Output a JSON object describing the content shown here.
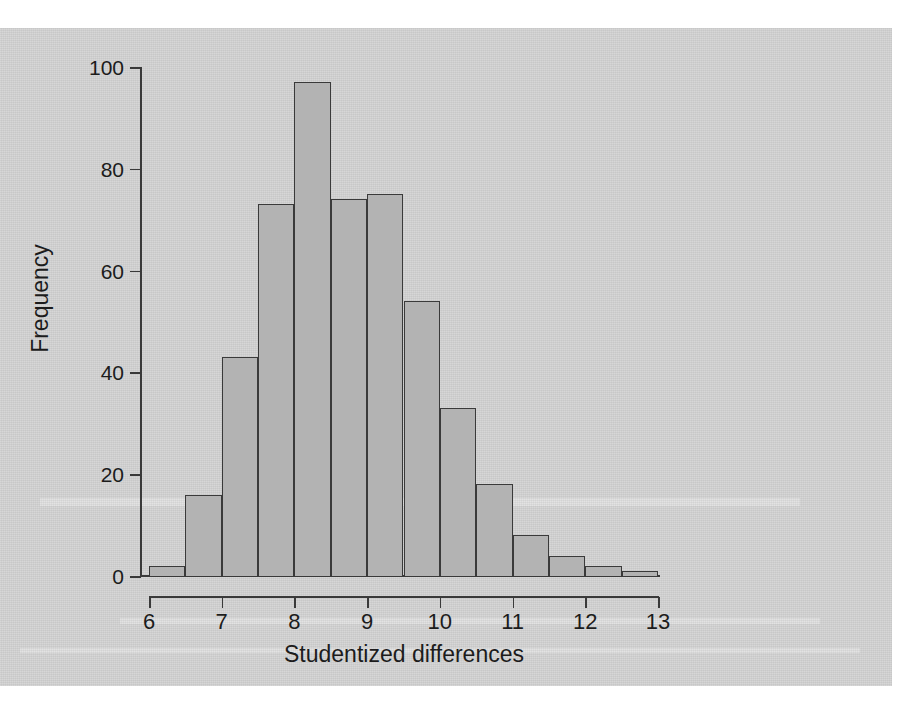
{
  "figure": {
    "background_color": "#d5d5d5",
    "bar_fill_color": "#b3b3b3",
    "bar_border_color": "#3a3a3a",
    "axis_color": "#3a3a3a"
  },
  "chart_data": {
    "type": "bar",
    "title": "",
    "xlabel": "Studentized differences",
    "ylabel": "Frequency",
    "xlim": [
      6,
      13
    ],
    "ylim": [
      0,
      100
    ],
    "xticks": [
      6,
      7,
      8,
      9,
      10,
      11,
      12,
      13
    ],
    "yticks": [
      0,
      20,
      40,
      60,
      80,
      100
    ],
    "xtick_labels": [
      "6",
      "7",
      "8",
      "9",
      "10",
      "11",
      "12",
      "13"
    ],
    "ytick_labels": [
      "0",
      "20",
      "40",
      "60",
      "80",
      "100"
    ],
    "grid": false,
    "legend": null,
    "bin_width": 0.5,
    "bin_edges": [
      6.0,
      6.5,
      7.0,
      7.5,
      8.0,
      8.5,
      9.0,
      9.5,
      10.0,
      10.5,
      11.0,
      11.5,
      12.0,
      12.5,
      13.0
    ],
    "categories": [
      "6.0-6.5",
      "6.5-7.0",
      "7.0-7.5",
      "7.5-8.0",
      "8.0-8.5",
      "8.5-9.0",
      "9.0-9.5",
      "9.5-10.0",
      "10.0-10.5",
      "10.5-11.0",
      "11.0-11.5",
      "11.5-12.0",
      "12.0-12.5",
      "12.5-13.0"
    ],
    "values": [
      2,
      16,
      43,
      73,
      97,
      74,
      75,
      54,
      33,
      18,
      8,
      4,
      2,
      1
    ]
  }
}
